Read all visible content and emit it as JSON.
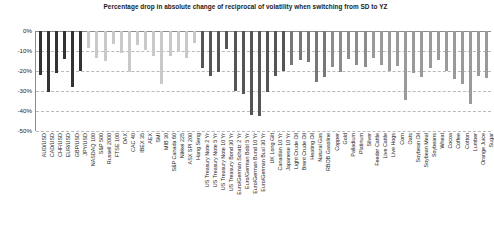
{
  "chart_data": {
    "type": "bar",
    "title": "Percentage drop in absolute change of reciprocal of volatility when switching from SD to YZ",
    "xlabel": "",
    "ylabel": "",
    "ylim": [
      -50,
      0
    ],
    "yticks": [
      0,
      -10,
      -20,
      -30,
      -40,
      -50
    ],
    "ytick_labels": [
      "0%",
      "-10%",
      "-20%",
      "-30%",
      "-40%",
      "-50%"
    ],
    "grid": true,
    "legend_position": "none",
    "orientation": "vertical",
    "bar_color_default": "#808080",
    "series_name": "Percentage drop",
    "categories": [
      "AUD/USD",
      "CAD/USD",
      "CHF/USD",
      "EUR/USD",
      "GBP/USD",
      "JPY/USD",
      "NASDAQ 100",
      "S&P 500",
      "Russell 2000",
      "FTSE 100",
      "DAX",
      "CAC 40",
      "IBEX 35",
      "AEX",
      "SMI",
      "MIB 30",
      "S&P Canada 60",
      "Nikkei 225",
      "ASX SPI 200",
      "Hang Seng",
      "US Treasury Note 2 Yr",
      "US Treasury Note 5 Yr",
      "US Treasury Note 10 Yr",
      "US Treasury Bond 30 Yr",
      "Euro/German Schatz 2 Yr",
      "Euro/German Bobl 5 Yr",
      "Euro/German Bund 10 Yr",
      "Euro/German Buxl 30 Yr",
      "UK Long Gilt",
      "Canadian 10 Yr",
      "Japanese 10 Yr",
      "Light Crude Oil",
      "Brent Crude Oil",
      "Heating Oil",
      "Natural Gas",
      "RBOB Gasoline",
      "Copper",
      "Gold",
      "Palladium",
      "Platinum",
      "Silver",
      "Feeder Cattle",
      "Live Cattle",
      "Live Hogs",
      "Corn",
      "Oats",
      "Soybean Oil",
      "Soybean Meal",
      "Soybeans",
      "Wheat",
      "Cocoa",
      "Coffee",
      "Cotton",
      "Lumber",
      "Orange Juice",
      "Sugar"
    ],
    "values": [
      -22.0,
      -30.5,
      -21.0,
      -14.0,
      -28.0,
      -20.0,
      -8.5,
      -13.5,
      -15.0,
      -6.5,
      -11.0,
      -20.5,
      -7.0,
      -9.5,
      -12.5,
      -26.5,
      -12.5,
      -10.5,
      -13.5,
      -6.0,
      -18.5,
      -22.5,
      -20.5,
      -9.0,
      -30.0,
      -31.5,
      -42.0,
      -42.5,
      -30.5,
      -22.5,
      -20.0,
      -17.0,
      -14.5,
      -15.5,
      -25.5,
      -23.0,
      -18.0,
      -20.5,
      -14.0,
      -17.0,
      -18.0,
      -13.5,
      -17.0,
      -20.0,
      -17.5,
      -34.5,
      -21.0,
      -23.0,
      -18.5,
      -14.5,
      -20.0,
      -24.0,
      -26.5,
      -36.5,
      -22.5,
      -23.5
    ],
    "bar_colors": [
      "#333333",
      "#333333",
      "#333333",
      "#333333",
      "#333333",
      "#333333",
      "#c9c9c9",
      "#c9c9c9",
      "#c9c9c9",
      "#c9c9c9",
      "#c9c9c9",
      "#c9c9c9",
      "#c9c9c9",
      "#c9c9c9",
      "#c9c9c9",
      "#c9c9c9",
      "#c9c9c9",
      "#c9c9c9",
      "#c9c9c9",
      "#c9c9c9",
      "#555555",
      "#555555",
      "#555555",
      "#555555",
      "#555555",
      "#555555",
      "#555555",
      "#555555",
      "#555555",
      "#555555",
      "#555555",
      "#777777",
      "#777777",
      "#777777",
      "#777777",
      "#777777",
      "#8c8c8c",
      "#8c8c8c",
      "#8c8c8c",
      "#8c8c8c",
      "#8c8c8c",
      "#9a9a9a",
      "#9a9a9a",
      "#9a9a9a",
      "#9a9a9a",
      "#9a9a9a",
      "#9a9a9a",
      "#9a9a9a",
      "#9a9a9a",
      "#9a9a9a",
      "#9a9a9a",
      "#9a9a9a",
      "#9a9a9a",
      "#9a9a9a",
      "#9a9a9a",
      "#9a9a9a"
    ]
  }
}
